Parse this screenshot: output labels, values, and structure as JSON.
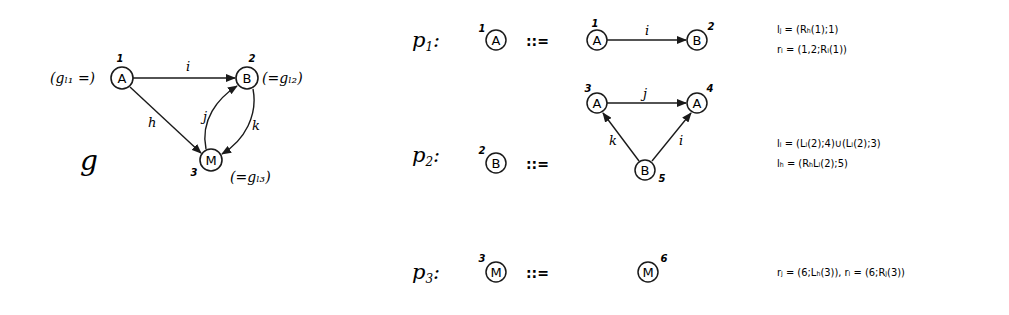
{
  "graph_g": {
    "name": "g",
    "nodes": [
      {
        "id": "1",
        "label": "A",
        "index": "1",
        "annotation": "(gₗ₁ =)"
      },
      {
        "id": "2",
        "label": "B",
        "index": "2",
        "annotation": "(=gₗ₂)"
      },
      {
        "id": "3",
        "label": "M",
        "index": "3",
        "annotation": "(=gₗ₃)"
      }
    ],
    "edges": [
      {
        "from": "1",
        "to": "2",
        "label": "i"
      },
      {
        "from": "1",
        "to": "3",
        "label": "h"
      },
      {
        "from": "3",
        "to": "2",
        "label": "j"
      },
      {
        "from": "2",
        "to": "3",
        "label": "k"
      }
    ]
  },
  "productions": [
    {
      "name": "p",
      "sub": "1",
      "colon": ":",
      "lhs": {
        "label": "A",
        "index": "1"
      },
      "op": "::=",
      "rhs": {
        "nodes": [
          {
            "label": "A",
            "index": "1"
          },
          {
            "label": "B",
            "index": "2"
          }
        ],
        "edges": [
          {
            "from": "1",
            "to": "2",
            "label": "i"
          }
        ]
      },
      "embedding": [
        "lⱼ = (Rₕ(1);1)",
        "rᵢ = (1,2;Rᵢ(1))"
      ]
    },
    {
      "name": "p",
      "sub": "2",
      "colon": ":",
      "lhs": {
        "label": "B",
        "index": "2"
      },
      "op": "::=",
      "rhs": {
        "nodes": [
          {
            "label": "A",
            "index": "3"
          },
          {
            "label": "A",
            "index": "4"
          },
          {
            "label": "B",
            "index": "5"
          }
        ],
        "edges": [
          {
            "from": "3",
            "to": "4",
            "label": "j"
          },
          {
            "from": "5",
            "to": "3",
            "label": "k"
          },
          {
            "from": "5",
            "to": "4",
            "label": "i"
          }
        ]
      },
      "embedding": [
        "lᵢ = (Lᵢ(2);4)∪(Lᵢ(2);3)",
        "lₕ = (RₕLᵢ(2);5)"
      ]
    },
    {
      "name": "p",
      "sub": "3",
      "colon": ":",
      "lhs": {
        "label": "M",
        "index": "3"
      },
      "op": "::=",
      "rhs": {
        "nodes": [
          {
            "label": "M",
            "index": "6"
          }
        ],
        "edges": []
      },
      "embedding": [
        "rⱼ = (6;Lₕ(3)),  rᵢ = (6;Rⱼ(3))"
      ]
    }
  ]
}
